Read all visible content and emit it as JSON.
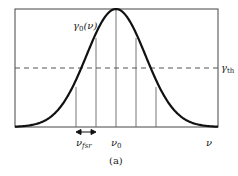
{
  "figure": {
    "caption": "(a)",
    "curve_label": {
      "main": "γ",
      "sub": "0",
      "tail": "(ν)"
    },
    "threshold_label": {
      "main": "γ",
      "sub": "th"
    },
    "x_axis_label": "ν",
    "center_label": {
      "main": "ν",
      "sub": "0"
    },
    "spacing_label": {
      "main": "ν",
      "sub": "fsr"
    },
    "colors": {
      "curve": "#111111",
      "frame": "#444444",
      "lines": "#666666",
      "dashed": "#555555"
    }
  },
  "chart_data": {
    "type": "line",
    "title": "",
    "xlabel": "ν",
    "ylabel": "",
    "series": [
      {
        "name": "γ0(ν)",
        "shape": "gaussian",
        "center": "ν0",
        "peak": 1.0
      },
      {
        "name": "γth",
        "style": "dashed",
        "value": 0.5
      }
    ],
    "vertical_markers": [
      "ν0-2νfsr",
      "ν0-νfsr",
      "ν0",
      "ν0+νfsr",
      "ν0+2νfsr"
    ],
    "annotations": [
      "γ0(ν)",
      "γth",
      "νfsr",
      "ν0",
      "ν",
      "(a)"
    ],
    "grid": false,
    "legend": "none"
  }
}
